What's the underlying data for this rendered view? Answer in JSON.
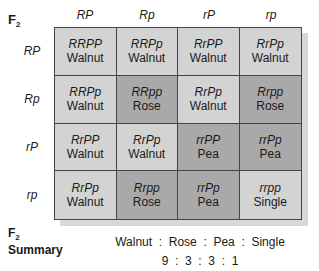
{
  "title": {
    "main": "F",
    "sub": "2"
  },
  "columns": [
    "RP",
    "Rp",
    "rP",
    "rp"
  ],
  "rows": [
    "RP",
    "Rp",
    "rP",
    "rp"
  ],
  "cells": [
    [
      {
        "genotype": "RRPP",
        "phenotype": "Walnut",
        "shade": "light"
      },
      {
        "genotype": "RRPp",
        "phenotype": "Walnut",
        "shade": "light"
      },
      {
        "genotype": "RrPP",
        "phenotype": "Walnut",
        "shade": "light"
      },
      {
        "genotype": "RrPp",
        "phenotype": "Walnut",
        "shade": "light"
      }
    ],
    [
      {
        "genotype": "RRPp",
        "phenotype": "Walnut",
        "shade": "light"
      },
      {
        "genotype": "RRpp",
        "phenotype": "Rose",
        "shade": "dark"
      },
      {
        "genotype": "RrPp",
        "phenotype": "Walnut",
        "shade": "light"
      },
      {
        "genotype": "Rrpp",
        "phenotype": "Rose",
        "shade": "dark"
      }
    ],
    [
      {
        "genotype": "RrPP",
        "phenotype": "Walnut",
        "shade": "light"
      },
      {
        "genotype": "RrPp",
        "phenotype": "Walnut",
        "shade": "light"
      },
      {
        "genotype": "rrPP",
        "phenotype": "Pea",
        "shade": "dark"
      },
      {
        "genotype": "rrPp",
        "phenotype": "Pea",
        "shade": "dark"
      }
    ],
    [
      {
        "genotype": "RrPp",
        "phenotype": "Walnut",
        "shade": "light"
      },
      {
        "genotype": "Rrpp",
        "phenotype": "Rose",
        "shade": "dark"
      },
      {
        "genotype": "rrPp",
        "phenotype": "Pea",
        "shade": "dark"
      },
      {
        "genotype": "rrpp",
        "phenotype": "Single",
        "shade": "light"
      }
    ]
  ],
  "summary": {
    "label_main": "F",
    "label_sub": "2",
    "label_word": "Summary",
    "phenotypes_line": "Walnut  :  Rose  :  Pea  :  Single",
    "ratio_line": "9  :  3  :  3  :  1"
  },
  "colors": {
    "light": "#d3d3d3",
    "dark": "#a9a9a9",
    "border": "#444444"
  }
}
